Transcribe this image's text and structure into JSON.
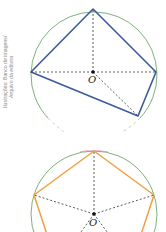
{
  "credit": {
    "line1": "Ilustrações: Banco de imagens/",
    "line2": "Arquivo da editora"
  },
  "figure1": {
    "center_label": "O",
    "polygon_color": "#3b5aa0",
    "circle_color": "#6fa86a",
    "description": "Quadrilateral inscribed in circle with dashed radii from center O"
  },
  "figure2": {
    "center_label": "O",
    "polygon_color": "#f0a040",
    "circle_color": "#6fa86a",
    "description": "Regular pentagon inscribed in circle with dashed radii from center O"
  }
}
